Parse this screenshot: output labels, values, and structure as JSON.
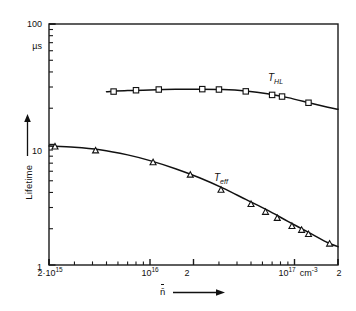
{
  "chart_data": {
    "type": "line",
    "title": "",
    "subtitle": "",
    "xlabel": "n̄",
    "ylabel": "Lifetime",
    "yunit": "µs",
    "xscale": "log",
    "yscale": "log",
    "xlim": [
      2000000000000000.0,
      2e+17
    ],
    "ylim": [
      1,
      100
    ],
    "grid": false,
    "legend_position": "inline-annotation",
    "y_tick_labels": [
      "1",
      "10",
      "100"
    ],
    "y_tick_values": [
      1,
      10,
      100
    ],
    "x_tick_labels": [
      "2·10",
      "10",
      "2",
      "10",
      "2"
    ],
    "x_tick_exponents": [
      "15",
      "16",
      "",
      "17",
      ""
    ],
    "x_tick_values": [
      2000000000000000.0,
      1e+16,
      2e+16,
      1e+17,
      2e+17
    ],
    "x_unit_label": "cm",
    "x_unit_exponent": "-3",
    "series": [
      {
        "name": "T_HL",
        "label": "T",
        "label_sub": "HL",
        "marker": "square",
        "points": [
          {
            "x": 5600000000000000.0,
            "y": 27.5
          },
          {
            "x": 8000000000000000.0,
            "y": 28.2
          },
          {
            "x": 1.15e+16,
            "y": 28.6
          },
          {
            "x": 2.3e+16,
            "y": 28.8
          },
          {
            "x": 3e+16,
            "y": 28.6
          },
          {
            "x": 4.6e+16,
            "y": 27.6
          },
          {
            "x": 7e+16,
            "y": 25.8
          },
          {
            "x": 8.2e+16,
            "y": 25.0
          },
          {
            "x": 1.25e+17,
            "y": 22.2
          }
        ],
        "line_x": [
          5000000000000000.0,
          7000000000000000.0,
          1e+16,
          1.5e+16,
          2.2e+16,
          3.2e+16,
          4.6e+16,
          6.5e+16,
          9e+16,
          1.3e+17,
          1.7e+17,
          2e+17
        ],
        "line_y": [
          27.4,
          28.0,
          28.4,
          28.7,
          28.8,
          28.6,
          27.8,
          26.4,
          24.5,
          22.0,
          20.4,
          19.6
        ]
      },
      {
        "name": "T_eff",
        "label": "T",
        "label_sub": "eff",
        "marker": "triangle",
        "points": [
          {
            "x": 2200000000000000.0,
            "y": 9.6
          },
          {
            "x": 4200000000000000.0,
            "y": 8.9
          },
          {
            "x": 1.05e+16,
            "y": 7.1
          },
          {
            "x": 1.9e+16,
            "y": 5.6
          },
          {
            "x": 3.1e+16,
            "y": 4.2
          },
          {
            "x": 5e+16,
            "y": 3.2
          },
          {
            "x": 6.3e+16,
            "y": 2.75
          },
          {
            "x": 7.6e+16,
            "y": 2.45
          },
          {
            "x": 9.6e+16,
            "y": 2.1
          },
          {
            "x": 1.12e+17,
            "y": 1.95
          },
          {
            "x": 1.25e+17,
            "y": 1.8
          },
          {
            "x": 1.75e+17,
            "y": 1.5
          }
        ],
        "line_x": [
          2000000000000000.0,
          3000000000000000.0,
          4500000000000000.0,
          7000000000000000.0,
          1e+16,
          1.5e+16,
          2.2e+16,
          3.2e+16,
          4.6e+16,
          6.5e+16,
          9e+16,
          1.3e+17,
          1.7e+17,
          2e+17
        ],
        "line_y": [
          9.7,
          9.5,
          9.05,
          8.2,
          7.35,
          6.3,
          5.3,
          4.35,
          3.5,
          2.85,
          2.3,
          1.82,
          1.53,
          1.42
        ]
      }
    ]
  }
}
